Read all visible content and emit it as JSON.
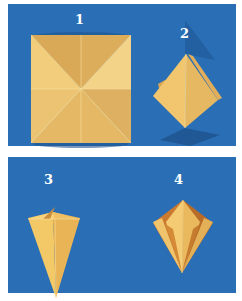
{
  "figure": {
    "background_color": "#2a6fb5",
    "paper_color": "#f0c060",
    "steps": [
      {
        "number": "1",
        "label": "Square with crease lines"
      },
      {
        "number": "2",
        "label": "Folded into square base (diamond)"
      },
      {
        "number": "3",
        "label": "Kite-shaped fold"
      },
      {
        "number": "4",
        "label": "Petal-shaped fold with layered flaps"
      }
    ]
  }
}
